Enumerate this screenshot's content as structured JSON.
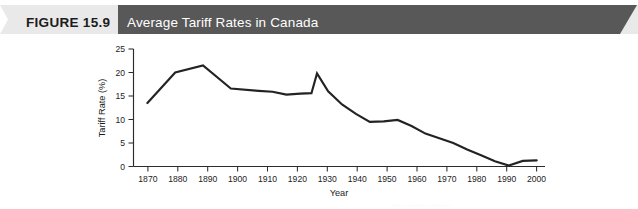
{
  "banner": {
    "figure_number": "FIGURE 15.9",
    "title": "Average Tariff Rates in Canada",
    "left_band_color": "#e8e8e8",
    "right_band_color": "#585858",
    "title_text_color": "#ffffff",
    "number_text_color": "#1c1c1c"
  },
  "chart_data": {
    "type": "line",
    "title": "Average Tariff Rates in Canada",
    "xlabel": "Year",
    "ylabel": "Tariff Rate (%)",
    "xlim": [
      1865,
      2013
    ],
    "ylim": [
      0,
      25
    ],
    "ytick_labels": [
      "0",
      "5",
      "10",
      "15",
      "20",
      "25"
    ],
    "yticks": [
      0,
      5,
      10,
      15,
      20,
      25
    ],
    "xtick_labels": [
      "1870",
      "1880",
      "1890",
      "1900",
      "1910",
      "1920",
      "1930",
      "1940",
      "1950",
      "1960",
      "1970",
      "1980",
      "1990",
      "2000",
      "2010"
    ],
    "xticks": [
      1870,
      1880,
      1890,
      1900,
      1910,
      1920,
      1930,
      1940,
      1950,
      1960,
      1970,
      1980,
      1990,
      2000,
      2010
    ],
    "grid": false,
    "legend": false,
    "line_color": "#232323",
    "series": [
      {
        "name": "Average Tariff Rate",
        "x": [
          1870,
          1880,
          1890,
          1900,
          1910,
          1915,
          1920,
          1925,
          1929,
          1931,
          1935,
          1940,
          1945,
          1950,
          1955,
          1960,
          1965,
          1970,
          1980,
          1985,
          1990,
          1995,
          2000,
          2005,
          2010
        ],
        "values": [
          13.5,
          20.0,
          21.5,
          16.6,
          16.1,
          15.9,
          15.3,
          15.5,
          15.6,
          19.8,
          16.0,
          13.2,
          11.2,
          9.5,
          9.6,
          9.9,
          8.6,
          7.0,
          5.0,
          3.6,
          2.4,
          1.1,
          0.2,
          1.2,
          1.3
        ]
      }
    ]
  },
  "source_fragment": "· · · · · · · · · · · · · · · · · · · ·"
}
